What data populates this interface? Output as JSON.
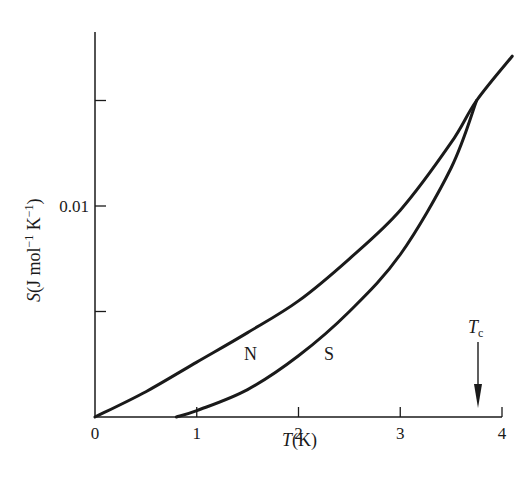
{
  "chart_data": {
    "type": "line",
    "title": "",
    "xlabel": "T(K)",
    "ylabel": "S(J mol⁻¹ K⁻¹)",
    "xlim": [
      0,
      4
    ],
    "ylim": [
      0,
      0.019
    ],
    "grid": false,
    "x_ticks": [
      0,
      1,
      2,
      3,
      4
    ],
    "x_tick_labels": [
      "0",
      "1",
      "2",
      "3",
      "4"
    ],
    "y_ticks": [
      0,
      0.005,
      0.01,
      0.015
    ],
    "y_tick_labels": [
      "",
      "",
      "0.01",
      ""
    ],
    "series": [
      {
        "name": "N",
        "description": "normal state entropy",
        "x": [
          0,
          0.5,
          1.0,
          1.5,
          2.0,
          2.5,
          3.0,
          3.5,
          3.75,
          4.1
        ],
        "values": [
          0,
          0.0012,
          0.0026,
          0.004,
          0.0055,
          0.0075,
          0.0098,
          0.013,
          0.015,
          0.0171
        ]
      },
      {
        "name": "S",
        "description": "superconducting state entropy",
        "x": [
          0.8,
          1.0,
          1.5,
          2.0,
          2.5,
          3.0,
          3.5,
          3.75
        ],
        "values": [
          0,
          0.0003,
          0.0013,
          0.0029,
          0.005,
          0.0077,
          0.0118,
          0.015
        ]
      }
    ],
    "annotations": [
      {
        "text": "N",
        "x": 1.55,
        "y": 0.003
      },
      {
        "text": "S",
        "x": 2.35,
        "y": 0.003
      },
      {
        "text": "Tc",
        "main": "T",
        "subscript": "c",
        "x": 3.72,
        "arrow_from_y": 0.0036,
        "arrow_to_y": 0.0008
      }
    ]
  },
  "labels": {
    "x_axis_title_italic": "T",
    "x_axis_title_rest": "(K)",
    "y_axis_title_italic": "S",
    "y_axis_title_rest": "(J mol",
    "y_axis_sup1": "−1",
    "y_axis_mid": " K",
    "y_axis_sup2": "−1",
    "y_axis_close": ")",
    "tc_main": "T",
    "tc_sub": "c",
    "n_label": "N",
    "s_label": "S"
  },
  "style": {
    "ink": "#1a1a1a",
    "background": "#ffffff"
  }
}
